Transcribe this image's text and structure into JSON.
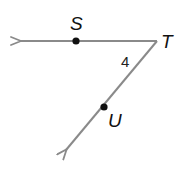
{
  "diagram": {
    "type": "angle",
    "vertex": {
      "label": "T",
      "x": 157,
      "y": 41
    },
    "rays": [
      {
        "name": "ray-TS",
        "through": {
          "label": "S",
          "x": 76,
          "y": 41
        },
        "end": {
          "x": 20,
          "y": 41
        }
      },
      {
        "name": "ray-TU",
        "through": {
          "label": "U",
          "x": 104,
          "y": 107
        },
        "end": {
          "x": 66,
          "y": 150
        }
      }
    ],
    "angle_label": "4",
    "points": [
      {
        "label": "S",
        "label_x": 77,
        "label_y": 27
      },
      {
        "label": "T",
        "label_x": 161,
        "label_y": 48
      },
      {
        "label": "U",
        "label_x": 108,
        "label_y": 125
      }
    ],
    "colors": {
      "line": "#8a8a8a",
      "point": "#111111",
      "text": "#111111"
    }
  }
}
